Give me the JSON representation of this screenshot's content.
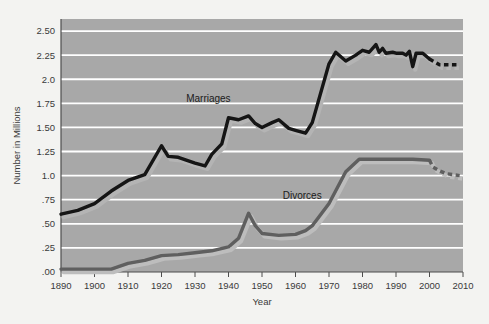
{
  "chart_data": {
    "type": "line",
    "title": "",
    "xlabel": "Year",
    "ylabel": "Number in Millions",
    "xlim": [
      1890,
      2010
    ],
    "ylim": [
      0.0,
      2.625
    ],
    "grid": true,
    "legend_position": "inline-annotations",
    "xticks": [
      1890,
      1900,
      1910,
      1920,
      1930,
      1940,
      1950,
      1960,
      1970,
      1980,
      1990,
      2000,
      2010
    ],
    "xticklabels": [
      "1890",
      "1900",
      "1910",
      "1920",
      "1930",
      "1940",
      "1950",
      "1960",
      "1970",
      "1980",
      "1990",
      "2000",
      "2010"
    ],
    "yticks": [
      0.0,
      0.25,
      0.5,
      0.75,
      1.0,
      1.25,
      1.5,
      1.75,
      2.0,
      2.25,
      2.5
    ],
    "yticklabels": [
      ".00",
      ".25",
      ".50",
      ".75",
      "1.0",
      "1.25",
      "1.50",
      "1.75",
      "2.0",
      "2.25",
      "2.50"
    ],
    "series": [
      {
        "name": "Marriages",
        "color": "#151515",
        "shadow_color": "#b4b4b4",
        "label_x": 1934,
        "label_y": 1.76,
        "solid_points": [
          [
            1890,
            0.6
          ],
          [
            1895,
            0.64
          ],
          [
            1900,
            0.71
          ],
          [
            1905,
            0.84
          ],
          [
            1910,
            0.95
          ],
          [
            1915,
            1.01
          ],
          [
            1920,
            1.31
          ],
          [
            1922,
            1.2
          ],
          [
            1925,
            1.19
          ],
          [
            1930,
            1.13
          ],
          [
            1933,
            1.1
          ],
          [
            1935,
            1.22
          ],
          [
            1938,
            1.33
          ],
          [
            1940,
            1.6
          ],
          [
            1943,
            1.58
          ],
          [
            1946,
            1.62
          ],
          [
            1948,
            1.54
          ],
          [
            1950,
            1.5
          ],
          [
            1953,
            1.55
          ],
          [
            1955,
            1.58
          ],
          [
            1958,
            1.49
          ],
          [
            1960,
            1.47
          ],
          [
            1963,
            1.44
          ],
          [
            1965,
            1.55
          ],
          [
            1970,
            2.16
          ],
          [
            1972,
            2.28
          ],
          [
            1975,
            2.19
          ],
          [
            1978,
            2.25
          ],
          [
            1980,
            2.3
          ],
          [
            1982,
            2.28
          ],
          [
            1984,
            2.36
          ],
          [
            1985,
            2.28
          ],
          [
            1986,
            2.32
          ],
          [
            1987,
            2.27
          ],
          [
            1989,
            2.28
          ],
          [
            1990,
            2.27
          ],
          [
            1992,
            2.27
          ],
          [
            1993,
            2.25
          ],
          [
            1994,
            2.29
          ],
          [
            1995,
            2.13
          ],
          [
            1996,
            2.27
          ],
          [
            1998,
            2.27
          ],
          [
            2000,
            2.21
          ]
        ],
        "projection_points": [
          [
            2001,
            2.19
          ],
          [
            2003,
            2.15
          ],
          [
            2005,
            2.15
          ],
          [
            2007,
            2.15
          ],
          [
            2009,
            2.15
          ]
        ],
        "projected": true
      },
      {
        "name": "Divorces",
        "color": "#5f5f5f",
        "shadow_color": "#bdbdbd",
        "label_x": 1962,
        "label_y": 0.76,
        "solid_points": [
          [
            1890,
            0.03
          ],
          [
            1900,
            0.03
          ],
          [
            1905,
            0.03
          ],
          [
            1910,
            0.09
          ],
          [
            1915,
            0.12
          ],
          [
            1920,
            0.17
          ],
          [
            1925,
            0.18
          ],
          [
            1930,
            0.2
          ],
          [
            1935,
            0.22
          ],
          [
            1940,
            0.26
          ],
          [
            1943,
            0.35
          ],
          [
            1946,
            0.61
          ],
          [
            1948,
            0.48
          ],
          [
            1950,
            0.4
          ],
          [
            1955,
            0.38
          ],
          [
            1960,
            0.39
          ],
          [
            1963,
            0.43
          ],
          [
            1965,
            0.48
          ],
          [
            1970,
            0.71
          ],
          [
            1975,
            1.04
          ],
          [
            1979,
            1.17
          ],
          [
            1982,
            1.17
          ],
          [
            1985,
            1.17
          ],
          [
            1990,
            1.17
          ],
          [
            1995,
            1.17
          ],
          [
            2000,
            1.16
          ]
        ],
        "projection_points": [
          [
            2001,
            1.09
          ],
          [
            2003,
            1.05
          ],
          [
            2005,
            1.02
          ],
          [
            2007,
            1.01
          ],
          [
            2009,
            1.0
          ]
        ],
        "projected": true
      }
    ]
  },
  "figure": {
    "plot_bg_color": "#a8a8a8",
    "page_bg_color": "#f3f3f1",
    "gridline_color": "#ffffff",
    "axis_color": "#4d4d4d"
  }
}
